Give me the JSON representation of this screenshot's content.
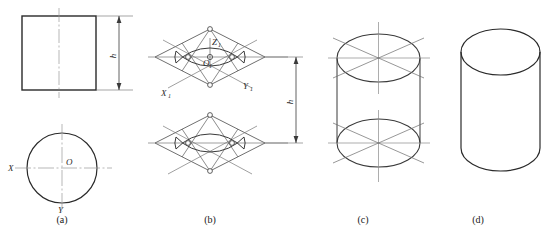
{
  "figure": {
    "panels": [
      {
        "id": "a",
        "caption": "(a)",
        "description": "Orthographic views: front view rectangle with height h, top view circle with axes X, Y and centre O",
        "labels": {
          "height": "h",
          "axis_x": "X",
          "axis_y": "Y",
          "centre": "O"
        }
      },
      {
        "id": "b",
        "caption": "(b)",
        "description": "Isometric rhombus construction of top and bottom ellipses by the four-centre method, separated by height h",
        "labels": {
          "axis_z": "Z",
          "axis_z_sub": "1",
          "origin": "O",
          "origin_sub": "1",
          "axis_x": "X",
          "axis_x_sub": "1",
          "axis_y": "Y",
          "axis_y_sub": "1",
          "height": "h"
        }
      },
      {
        "id": "c",
        "caption": "(c)",
        "description": "Top and bottom isometric ellipses joined by vertical tangent outlines, construction axes retained"
      },
      {
        "id": "d",
        "caption": "(d)",
        "description": "Finished isometric cylinder with construction lines removed"
      }
    ]
  },
  "colors": {
    "outline": "#2a2a2a",
    "construction": "#555555",
    "centerline": "#888888",
    "background": "#ffffff"
  }
}
